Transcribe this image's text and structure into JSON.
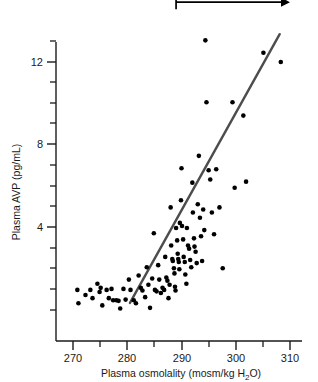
{
  "chart_data": {
    "type": "scatter",
    "title": "",
    "xlabel": "Plasma osmolality (mosm/kg H₂O)",
    "ylabel": "Plasma AVP (pg/mL)",
    "xlim": [
      268,
      312
    ],
    "ylim": [
      -0.7,
      13.6
    ],
    "grid": false,
    "legend": null,
    "x_ticks_major": [
      270,
      280,
      290,
      300,
      310
    ],
    "x_tick_labels": [
      "270",
      "280",
      "290",
      "300",
      "310"
    ],
    "x_ticks_minor": [
      275,
      285,
      295,
      305
    ],
    "y_ticks_major": [
      4,
      8,
      12
    ],
    "y_tick_labels": [
      "4",
      "8",
      "12"
    ],
    "y_ticks_minor": [
      1,
      2,
      3,
      5,
      6,
      7,
      9,
      10,
      11,
      13
    ],
    "marker": {
      "shape": "circle",
      "color": "#000000",
      "size": 4.6
    },
    "points": [
      [
        270.8,
        0.95
      ],
      [
        271.0,
        0.3
      ],
      [
        272.3,
        0.7
      ],
      [
        273.2,
        0.95
      ],
      [
        273.6,
        0.55
      ],
      [
        274.5,
        1.25
      ],
      [
        274.9,
        0.85
      ],
      [
        275.1,
        1.05
      ],
      [
        275.4,
        0.2
      ],
      [
        276.2,
        0.95
      ],
      [
        276.6,
        0.55
      ],
      [
        277.1,
        1.0
      ],
      [
        277.4,
        0.45
      ],
      [
        278.0,
        0.45
      ],
      [
        278.4,
        0.42
      ],
      [
        278.7,
        0.05
      ],
      [
        279.3,
        1.0
      ],
      [
        279.7,
        0.48
      ],
      [
        280.3,
        1.45
      ],
      [
        280.6,
        0.95
      ],
      [
        281.2,
        0.45
      ],
      [
        281.6,
        0.3
      ],
      [
        282.1,
        1.65
      ],
      [
        282.5,
        1.05
      ],
      [
        282.8,
        0.92
      ],
      [
        283.3,
        0.6
      ],
      [
        283.6,
        2.05
      ],
      [
        283.9,
        1.2
      ],
      [
        284.2,
        0.08
      ],
      [
        284.6,
        1.5
      ],
      [
        284.9,
        3.7
      ],
      [
        285.1,
        0.95
      ],
      [
        285.4,
        0.88
      ],
      [
        285.7,
        2.15
      ],
      [
        285.9,
        1.45
      ],
      [
        286.2,
        0.8
      ],
      [
        286.5,
        1.05
      ],
      [
        286.8,
        0.95
      ],
      [
        287.0,
        2.55
      ],
      [
        287.2,
        1.55
      ],
      [
        287.4,
        1.4
      ],
      [
        287.6,
        0.55
      ],
      [
        287.8,
        1.2
      ],
      [
        288.0,
        4.95
      ],
      [
        288.1,
        3.1
      ],
      [
        288.3,
        2.45
      ],
      [
        288.4,
        2.35
      ],
      [
        288.6,
        2.0
      ],
      [
        288.7,
        1.75
      ],
      [
        288.8,
        1.1
      ],
      [
        288.9,
        0.92
      ],
      [
        289.0,
        3.95
      ],
      [
        289.2,
        3.35
      ],
      [
        289.3,
        2.7
      ],
      [
        289.4,
        2.45
      ],
      [
        289.5,
        2.3
      ],
      [
        289.6,
        1.95
      ],
      [
        289.7,
        4.2
      ],
      [
        289.9,
        5.3
      ],
      [
        290.0,
        6.85
      ],
      [
        290.1,
        4.05
      ],
      [
        290.3,
        3.4
      ],
      [
        290.4,
        2.55
      ],
      [
        290.6,
        2.3
      ],
      [
        290.7,
        1.7
      ],
      [
        290.9,
        1.25
      ],
      [
        291.0,
        3.95
      ],
      [
        291.2,
        3.1
      ],
      [
        291.4,
        2.95
      ],
      [
        291.6,
        2.4
      ],
      [
        291.8,
        2.05
      ],
      [
        292.0,
        6.15
      ],
      [
        292.1,
        4.7
      ],
      [
        292.3,
        3.45
      ],
      [
        292.4,
        3.05
      ],
      [
        292.6,
        2.8
      ],
      [
        292.8,
        2.25
      ],
      [
        293.0,
        5.1
      ],
      [
        293.2,
        7.45
      ],
      [
        293.4,
        4.45
      ],
      [
        293.6,
        3.55
      ],
      [
        293.8,
        2.35
      ],
      [
        294.0,
        4.85
      ],
      [
        294.2,
        3.85
      ],
      [
        294.4,
        13.05
      ],
      [
        294.6,
        10.05
      ],
      [
        295.0,
        6.75
      ],
      [
        295.3,
        6.3
      ],
      [
        295.6,
        4.7
      ],
      [
        296.0,
        3.65
      ],
      [
        296.4,
        6.8
      ],
      [
        297.0,
        4.95
      ],
      [
        297.6,
        2.0
      ],
      [
        299.4,
        10.05
      ],
      [
        299.8,
        5.9
      ],
      [
        301.4,
        9.4
      ],
      [
        301.9,
        6.2
      ],
      [
        305.1,
        12.45
      ],
      [
        308.3,
        12.0
      ]
    ],
    "trend_line": {
      "label": "regression line",
      "color": "#4d4d4d",
      "width": 2.4,
      "x_start": 280.5,
      "y_start": 0.32,
      "x_end": 308.1,
      "y_end": 13.35
    },
    "annotations": [
      {
        "name": "thirst-arrow",
        "label": "Thirst",
        "x_start": 289.0,
        "x_end": 310.0,
        "y": 14.9,
        "style": "bar-to-arrow",
        "color": "#000000"
      }
    ]
  }
}
